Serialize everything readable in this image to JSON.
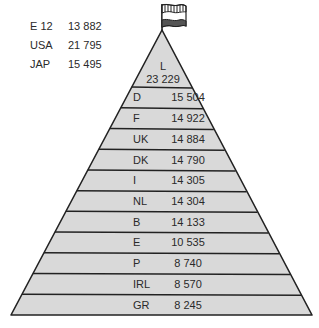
{
  "legend": [
    {
      "label": "E 12",
      "value": "13 882"
    },
    {
      "label": "USA",
      "value": "21 795"
    },
    {
      "label": "JAP",
      "value": "15 495"
    }
  ],
  "pyramid": {
    "top": {
      "label": "L",
      "value": "23 229"
    },
    "tiers": [
      {
        "label": "D",
        "value": "15 504"
      },
      {
        "label": "F",
        "value": "14 922"
      },
      {
        "label": "UK",
        "value": "14 884"
      },
      {
        "label": "DK",
        "value": "14 790"
      },
      {
        "label": "I",
        "value": "14 305"
      },
      {
        "label": "NL",
        "value": "14 304"
      },
      {
        "label": "B",
        "value": "14 133"
      },
      {
        "label": "E",
        "value": "10 535"
      },
      {
        "label": "P",
        "value": "8 740"
      },
      {
        "label": "IRL",
        "value": "8 570"
      },
      {
        "label": "GR",
        "value": "8 245"
      }
    ]
  },
  "colors": {
    "fill": "#d9d9d9",
    "stroke": "#222222",
    "text": "#2a2a2a"
  }
}
